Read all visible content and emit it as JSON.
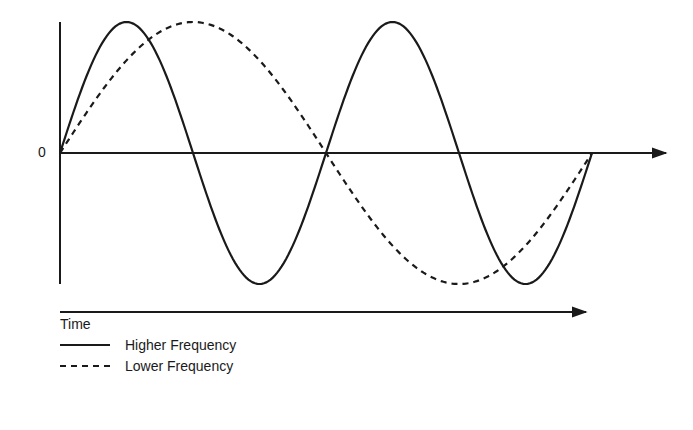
{
  "chart_data": {
    "type": "line",
    "title": "",
    "xlabel": "Time",
    "ylabel": "",
    "y_tick_labels": [
      "0"
    ],
    "grid": false,
    "legend_position": "bottom-left",
    "x_range": [
      0,
      1
    ],
    "y_range": [
      -1,
      1
    ],
    "series": [
      {
        "name": "Higher Frequency",
        "style": "solid",
        "cycles": 2,
        "x": [
          0,
          0.125,
          0.25,
          0.375,
          0.5,
          0.625,
          0.75,
          0.875,
          1
        ],
        "values": [
          0,
          1,
          0,
          -1,
          0,
          1,
          0,
          -1,
          0
        ]
      },
      {
        "name": "Lower Frequency",
        "style": "dashed",
        "cycles": 1,
        "x": [
          0,
          0.125,
          0.25,
          0.375,
          0.5,
          0.625,
          0.75,
          0.875,
          1
        ],
        "values": [
          0,
          0.707,
          1,
          0.707,
          0,
          -0.707,
          -1,
          -0.707,
          0
        ]
      }
    ]
  },
  "labels": {
    "zero": "0",
    "time": "Time"
  },
  "legend": [
    {
      "label": "Higher Frequency",
      "style": "solid"
    },
    {
      "label": "Lower Frequency",
      "style": "dashed"
    }
  ],
  "colors": {
    "ink": "#1a1a1a",
    "background": "#ffffff"
  }
}
